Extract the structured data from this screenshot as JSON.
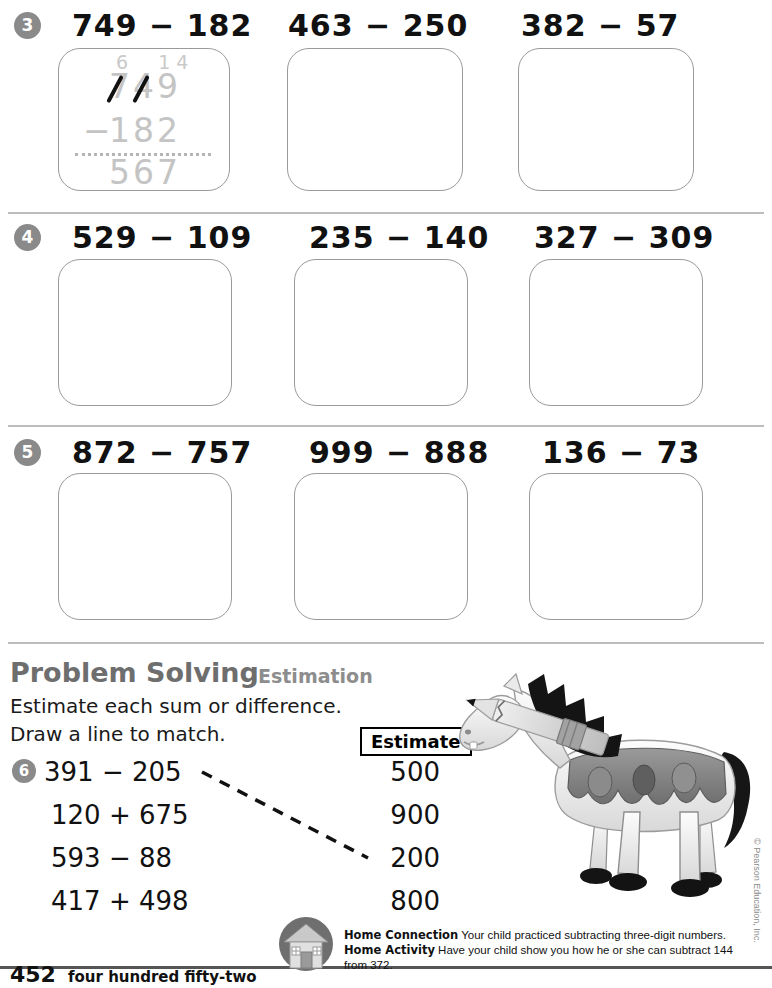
{
  "page": {
    "number": "452",
    "number_words": "four hundred fifty-two",
    "copyright": "© Pearson Education, Inc."
  },
  "exercise_rows": [
    {
      "number": "3",
      "problems": [
        {
          "expression": "749 − 182",
          "worked": true
        },
        {
          "expression": "463 − 250",
          "worked": false
        },
        {
          "expression": "382 − 57",
          "worked": false
        }
      ]
    },
    {
      "number": "4",
      "problems": [
        {
          "expression": "529 − 109",
          "worked": false
        },
        {
          "expression": "235 − 140",
          "worked": false
        },
        {
          "expression": "327 − 309",
          "worked": false
        }
      ]
    },
    {
      "number": "5",
      "problems": [
        {
          "expression": "872 − 757",
          "worked": false
        },
        {
          "expression": "999 − 888",
          "worked": false
        },
        {
          "expression": "136 − 73",
          "worked": false
        }
      ]
    }
  ],
  "worked_example": {
    "regroup_top": "6  14",
    "minuend": "749",
    "subtrahend": "182",
    "minus_sign": "−",
    "difference": "567"
  },
  "problem_solving": {
    "heading": "Problem Solving",
    "subheading": "Estimation",
    "instruction_line1": "Estimate each sum or difference.",
    "instruction_line2": "Draw a line to match.",
    "number": "6",
    "estimate_header": "Estimate",
    "expressions": [
      "391 − 205",
      "120 + 675",
      "593 − 88",
      "417 + 498"
    ],
    "estimates": [
      "500",
      "900",
      "200",
      "800"
    ],
    "match_line": {
      "from_expression_index": 0,
      "to_estimate_index": 2
    }
  },
  "home_connection": {
    "connection_label": "Home Connection",
    "connection_text": "Your child practiced subtracting three-digit numbers.",
    "activity_label": "Home Activity",
    "activity_text": "Have your child show you how he or she can subtract 144 from 372.",
    "icon": "house-icon"
  },
  "colors": {
    "badge_gray": "#8a8a8a",
    "box_border": "#9a9a9a",
    "separator": "#bdbdbd",
    "heading_gray": "#6e6e6e",
    "trace_gray": "#c4c4c4"
  }
}
